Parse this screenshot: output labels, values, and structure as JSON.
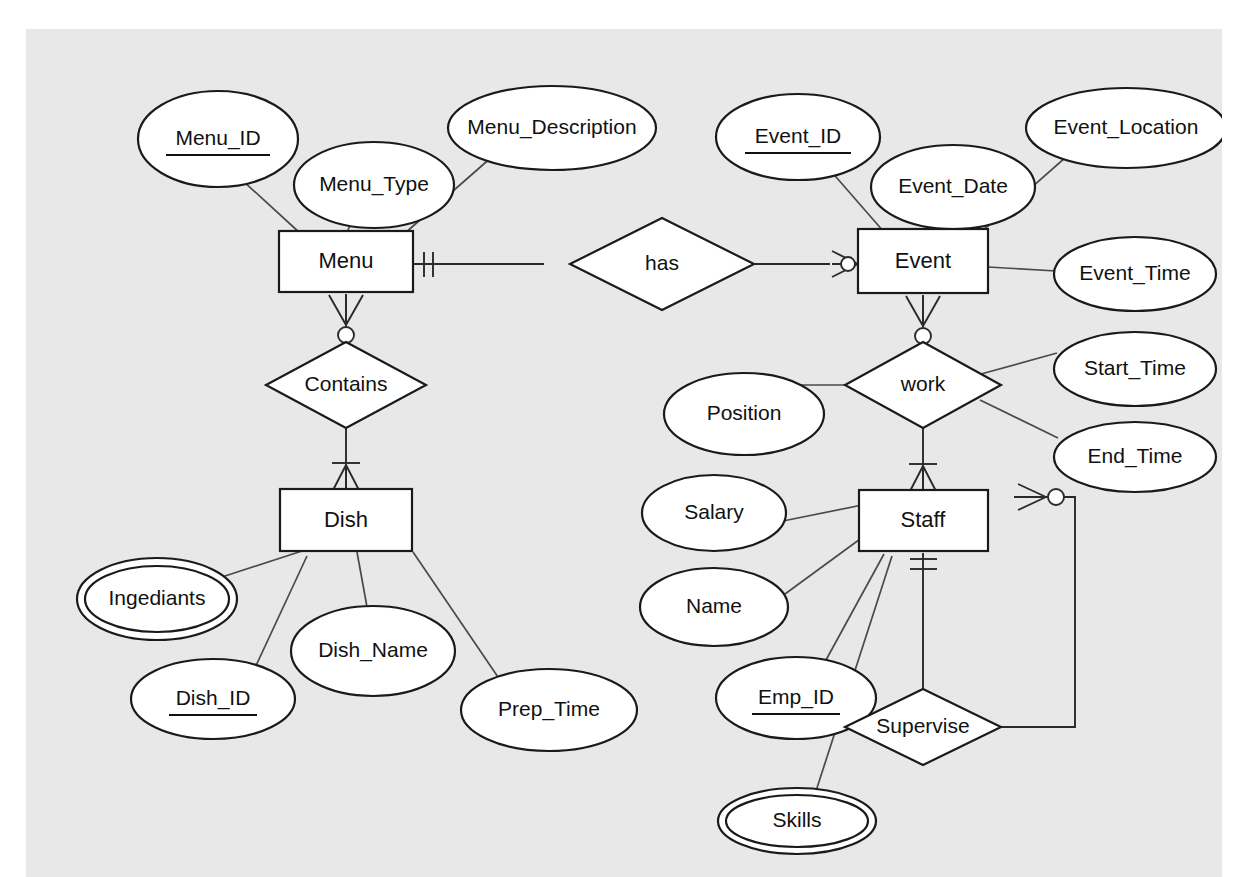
{
  "diagram": {
    "notation": "crow's foot",
    "canvas_background": "#e8e8e8",
    "page_background": "#ffffff",
    "line_color": "#4a4a4a",
    "shape_fill": "#ffffff",
    "shape_stroke": "#1a1a1a"
  },
  "entities": [
    {
      "id": "menu",
      "label": "Menu",
      "x": 279,
      "y": 231,
      "w": 134,
      "h": 61
    },
    {
      "id": "event",
      "label": "Event",
      "x": 858,
      "y": 229,
      "w": 130,
      "h": 64
    },
    {
      "id": "dish",
      "label": "Dish",
      "x": 280,
      "y": 489,
      "w": 132,
      "h": 62
    },
    {
      "id": "staff",
      "label": "Staff",
      "x": 859,
      "y": 490,
      "w": 129,
      "h": 61
    }
  ],
  "relationships": [
    {
      "id": "has",
      "label": "has",
      "cx": 636,
      "cy": 262,
      "rx": 92,
      "ry": 46
    },
    {
      "id": "contains",
      "label": "Contains",
      "cx": 346,
      "cy": 384,
      "rx": 80,
      "ry": 42
    },
    {
      "id": "work",
      "label": "work",
      "cx": 923,
      "cy": 384,
      "rx": 78,
      "ry": 42
    },
    {
      "id": "supervise",
      "label": "Supervise",
      "cx": 922,
      "cy": 727,
      "rx": 78,
      "ry": 38
    }
  ],
  "attributes": [
    {
      "id": "menu_id",
      "label": "Menu_ID",
      "owner": "menu",
      "cx": 192,
      "cy": 110,
      "rx": 80,
      "ry": 48,
      "key": true,
      "multivalued": false
    },
    {
      "id": "menu_type",
      "label": "Menu_Type",
      "owner": "menu",
      "cx": 348,
      "cy": 156,
      "rx": 80,
      "ry": 43,
      "key": false,
      "multivalued": false
    },
    {
      "id": "menu_description",
      "label": "Menu_Description",
      "owner": "menu",
      "cx": 526,
      "cy": 99,
      "rx": 104,
      "ry": 42,
      "key": false,
      "multivalued": false
    },
    {
      "id": "event_id",
      "label": "Event_ID",
      "owner": "event",
      "cx": 772,
      "cy": 108,
      "rx": 82,
      "ry": 43,
      "key": true,
      "multivalued": false
    },
    {
      "id": "event_date",
      "label": "Event_Date",
      "owner": "event",
      "cx": 927,
      "cy": 158,
      "rx": 82,
      "ry": 42,
      "key": false,
      "multivalued": false
    },
    {
      "id": "event_location",
      "label": "Event_Location",
      "owner": "event",
      "cx": 1100,
      "cy": 99,
      "rx": 100,
      "ry": 40,
      "key": false,
      "multivalued": false
    },
    {
      "id": "event_time",
      "label": "Event_Time",
      "owner": "event",
      "cx": 1109,
      "cy": 245,
      "rx": 81,
      "ry": 37,
      "key": false,
      "multivalued": false
    },
    {
      "id": "start_time",
      "label": "Start_Time",
      "owner": "work",
      "cx": 1109,
      "cy": 340,
      "rx": 81,
      "ry": 37,
      "key": false,
      "multivalued": false
    },
    {
      "id": "end_time",
      "label": "End_Time",
      "owner": "work",
      "cx": 1109,
      "cy": 428,
      "rx": 81,
      "ry": 35,
      "key": false,
      "multivalued": false
    },
    {
      "id": "position",
      "label": "Position",
      "owner": "work",
      "cx": 718,
      "cy": 385,
      "rx": 80,
      "ry": 41,
      "key": false,
      "multivalued": false
    },
    {
      "id": "ingediants",
      "label": "Ingediants",
      "owner": "dish",
      "cx": 131,
      "cy": 570,
      "rx": 80,
      "ry": 41,
      "key": false,
      "multivalued": true
    },
    {
      "id": "dish_id",
      "label": "Dish_ID",
      "owner": "dish",
      "cx": 187,
      "cy": 670,
      "rx": 82,
      "ry": 40,
      "key": true,
      "multivalued": false
    },
    {
      "id": "dish_name",
      "label": "Dish_Name",
      "owner": "dish",
      "cx": 347,
      "cy": 622,
      "rx": 82,
      "ry": 45,
      "key": false,
      "multivalued": false
    },
    {
      "id": "prep_time",
      "label": "Prep_Time",
      "owner": "dish",
      "cx": 523,
      "cy": 681,
      "rx": 88,
      "ry": 41,
      "key": false,
      "multivalued": false
    },
    {
      "id": "salary",
      "label": "Salary",
      "owner": "staff",
      "cx": 688,
      "cy": 484,
      "rx": 72,
      "ry": 38,
      "key": false,
      "multivalued": false
    },
    {
      "id": "name",
      "label": "Name",
      "owner": "staff",
      "cx": 688,
      "cy": 578,
      "rx": 74,
      "ry": 39,
      "key": false,
      "multivalued": false
    },
    {
      "id": "emp_id",
      "label": "Emp_ID",
      "owner": "staff",
      "cx": 770,
      "cy": 669,
      "rx": 80,
      "ry": 41,
      "key": true,
      "multivalued": false
    },
    {
      "id": "skills",
      "label": "Skills",
      "owner": "staff",
      "cx": 771,
      "cy": 792,
      "rx": 79,
      "ry": 33,
      "key": false,
      "multivalued": true
    }
  ],
  "connections": [
    {
      "from": "menu_id",
      "to": "menu",
      "kind": "attribute"
    },
    {
      "from": "menu_type",
      "to": "menu",
      "kind": "attribute"
    },
    {
      "from": "menu_description",
      "to": "menu",
      "kind": "attribute"
    },
    {
      "from": "event_id",
      "to": "event",
      "kind": "attribute"
    },
    {
      "from": "event_date",
      "to": "event",
      "kind": "attribute"
    },
    {
      "from": "event_location",
      "to": "event",
      "kind": "attribute"
    },
    {
      "from": "event_time",
      "to": "event",
      "kind": "attribute"
    },
    {
      "from": "position",
      "to": "work",
      "kind": "attribute"
    },
    {
      "from": "start_time",
      "to": "work",
      "kind": "attribute"
    },
    {
      "from": "end_time",
      "to": "work",
      "kind": "attribute"
    },
    {
      "from": "ingediants",
      "to": "dish",
      "kind": "attribute"
    },
    {
      "from": "dish_id",
      "to": "dish",
      "kind": "attribute"
    },
    {
      "from": "dish_name",
      "to": "dish",
      "kind": "attribute"
    },
    {
      "from": "prep_time",
      "to": "dish",
      "kind": "attribute"
    },
    {
      "from": "salary",
      "to": "staff",
      "kind": "attribute"
    },
    {
      "from": "name",
      "to": "staff",
      "kind": "attribute"
    },
    {
      "from": "emp_id",
      "to": "staff",
      "kind": "attribute"
    },
    {
      "from": "skills",
      "to": "staff",
      "kind": "attribute"
    },
    {
      "from": "menu",
      "to": "has",
      "kind": "relationship",
      "cardinality": "exactly-one"
    },
    {
      "from": "event",
      "to": "has",
      "kind": "relationship",
      "cardinality": "zero-or-many"
    },
    {
      "from": "menu",
      "to": "contains",
      "kind": "relationship",
      "cardinality": "zero-or-many"
    },
    {
      "from": "dish",
      "to": "contains",
      "kind": "relationship",
      "cardinality": "one-or-many"
    },
    {
      "from": "event",
      "to": "work",
      "kind": "relationship",
      "cardinality": "zero-or-many"
    },
    {
      "from": "staff",
      "to": "work",
      "kind": "relationship",
      "cardinality": "one-or-many"
    },
    {
      "from": "staff",
      "to": "supervise",
      "kind": "relationship",
      "cardinality": "exactly-one"
    },
    {
      "from": "supervise",
      "to": "staff",
      "kind": "relationship",
      "cardinality": "zero-or-many"
    }
  ]
}
